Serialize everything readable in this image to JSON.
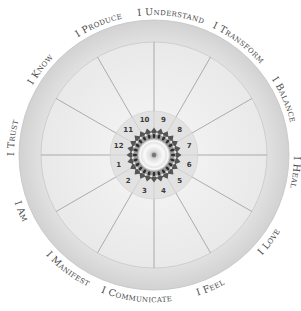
{
  "diagram": {
    "center": [
      154,
      155
    ],
    "outer_radius": 135,
    "ring_inner_radius": 113,
    "number_ring_outer": 44,
    "number_ring_inner": 27,
    "mandala_radius": 26,
    "colors": {
      "outer_ring": "#d9d9d9",
      "ring_border": "#c4c4c4",
      "field": "#ededed",
      "spoke": "#9a9a9a",
      "number_ring": "#e2e2e2",
      "mandala_dark": "#555555",
      "mandala_light": "#f4f4f4"
    },
    "labels": [
      {
        "text": "I Understand",
        "angle": 7
      },
      {
        "text": "I Transform",
        "angle": 37
      },
      {
        "text": "I Balance",
        "angle": 67
      },
      {
        "text": "I Heal",
        "angle": 97
      },
      {
        "text": "I Love",
        "angle": 127
      },
      {
        "text": "I Feel",
        "angle": 157
      },
      {
        "text": "I Communicate",
        "angle": 187
      },
      {
        "text": "I Manifest",
        "angle": 217
      },
      {
        "text": "I Am",
        "angle": 247
      },
      {
        "text": "I Trust",
        "angle": 277
      },
      {
        "text": "I Know",
        "angle": 307
      },
      {
        "text": "I Produce",
        "angle": 337
      }
    ],
    "numbers": [
      {
        "n": "9",
        "angle": 15
      },
      {
        "n": "8",
        "angle": 45
      },
      {
        "n": "7",
        "angle": 75
      },
      {
        "n": "6",
        "angle": 105
      },
      {
        "n": "5",
        "angle": 135
      },
      {
        "n": "4",
        "angle": 165
      },
      {
        "n": "3",
        "angle": 195
      },
      {
        "n": "2",
        "angle": 225
      },
      {
        "n": "1",
        "angle": 255
      },
      {
        "n": "12",
        "angle": 285
      },
      {
        "n": "11",
        "angle": 315
      },
      {
        "n": "10",
        "angle": 345
      }
    ],
    "spoke_angles": [
      0,
      30,
      60,
      90,
      120,
      150,
      180,
      210,
      240,
      270,
      300,
      330
    ]
  }
}
